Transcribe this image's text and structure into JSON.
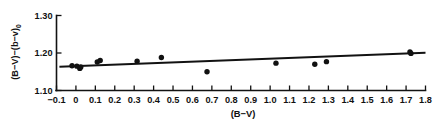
{
  "chart_data": {
    "type": "scatter",
    "title": "",
    "xlabel": "(B−V)",
    "ylabel": "(B−V)−(b−v)₀",
    "ylabel_main": "(B−V)−(b−v)",
    "ylabel_subscript": "0",
    "xlim": [
      -0.1,
      1.8
    ],
    "ylim": [
      1.1,
      1.3
    ],
    "grid": false,
    "legend": false,
    "xticks": [
      -0.1,
      0,
      0.1,
      0.2,
      0.3,
      0.4,
      0.5,
      0.6,
      0.7,
      0.8,
      0.9,
      1.0,
      1.1,
      1.2,
      1.3,
      1.4,
      1.5,
      1.6,
      1.7,
      1.8
    ],
    "xtick_labels": [
      "−0.1",
      "0",
      "0.1",
      "0.2",
      "0.3",
      "0.4",
      "0.5",
      "0.6",
      "0.7",
      "0.8",
      "0.9",
      "1.0",
      "1.1",
      "1.2",
      "1.3",
      "1.4",
      "1.5",
      "1.6",
      "1.7",
      "1.8"
    ],
    "yticks": [
      1.1,
      1.2,
      1.3
    ],
    "ytick_labels": [
      "1.10",
      "1.20",
      "1.30"
    ],
    "points": [
      {
        "x": -0.02,
        "y": 1.166
      },
      {
        "x": 0.005,
        "y": 1.165
      },
      {
        "x": 0.02,
        "y": 1.159
      },
      {
        "x": 0.025,
        "y": 1.163
      },
      {
        "x": 0.11,
        "y": 1.176
      },
      {
        "x": 0.125,
        "y": 1.18
      },
      {
        "x": 0.315,
        "y": 1.178
      },
      {
        "x": 0.44,
        "y": 1.188
      },
      {
        "x": 0.675,
        "y": 1.15
      },
      {
        "x": 1.03,
        "y": 1.173
      },
      {
        "x": 1.23,
        "y": 1.17
      },
      {
        "x": 1.29,
        "y": 1.177
      },
      {
        "x": 1.72,
        "y": 1.203
      },
      {
        "x": 1.725,
        "y": 1.199
      }
    ],
    "fit_line": {
      "x_start": -0.085,
      "y_start": 1.1635,
      "x_end": 1.8,
      "y_end": 1.2005
    }
  }
}
